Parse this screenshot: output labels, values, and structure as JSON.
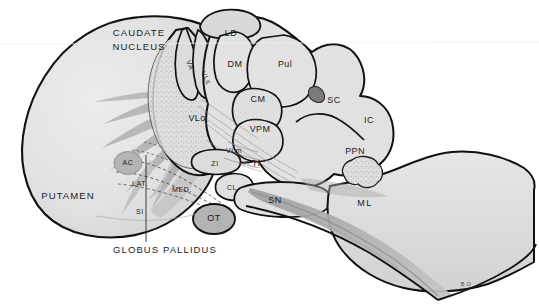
{
  "figure": {
    "signature": "B.O",
    "background_color": "#ffffff",
    "outline_color": "#111111",
    "fill_light": "#e3e3e3",
    "fill_mid": "#c9c9c9",
    "fill_dark": "#a8a8a8",
    "fill_darker": "#9a9a9a"
  },
  "labels": {
    "caudate_line1": "CAUDATE",
    "caudate_line2": "NUCLEUS",
    "putamen": "PUTAMEN",
    "globus_pallidus": "GLOBUS PALLIDUS",
    "lat": "LAT.",
    "med": "MED.",
    "ac": "AC",
    "si": "SI",
    "ot": "OT",
    "ld": "LD",
    "va": "VA",
    "vlc": "VLc",
    "vlo": "VLo",
    "vlm": "VLm",
    "dm": "DM",
    "pul": "Pul",
    "cm": "CM",
    "vpm": "VPM",
    "zi": "ZI",
    "h": "H",
    "cl": "CL",
    "sn": "SN",
    "sc": "SC",
    "ic": "IC",
    "ppn": "PPN",
    "ml": "ML"
  },
  "structures": [
    {
      "abbr": "CAUDATE NUCLEUS",
      "name": "Caudate nucleus"
    },
    {
      "abbr": "PUTAMEN",
      "name": "Putamen"
    },
    {
      "abbr": "GLOBUS PALLIDUS",
      "name": "Globus pallidus"
    },
    {
      "abbr": "LAT.",
      "name": "Lateral globus pallidus segment"
    },
    {
      "abbr": "MED.",
      "name": "Medial globus pallidus segment"
    },
    {
      "abbr": "AC",
      "name": "Anterior commissure"
    },
    {
      "abbr": "SI",
      "name": "Substantia innominata"
    },
    {
      "abbr": "OT",
      "name": "Optic tract"
    },
    {
      "abbr": "LD",
      "name": "Laterodorsal nucleus"
    },
    {
      "abbr": "VA",
      "name": "Ventral anterior nucleus"
    },
    {
      "abbr": "VLc",
      "name": "Ventral lateral caudal nucleus"
    },
    {
      "abbr": "VLo",
      "name": "Ventral lateral oral nucleus"
    },
    {
      "abbr": "VLm",
      "name": "Ventral lateral medial nucleus"
    },
    {
      "abbr": "DM",
      "name": "Dorsomedial nucleus"
    },
    {
      "abbr": "Pul",
      "name": "Pulvinar"
    },
    {
      "abbr": "CM",
      "name": "Centromedian nucleus"
    },
    {
      "abbr": "VPM",
      "name": "Ventral posteromedial nucleus"
    },
    {
      "abbr": "ZI",
      "name": "Zona incerta"
    },
    {
      "abbr": "H",
      "name": "Field H of Forel"
    },
    {
      "abbr": "CL",
      "name": "Caudal nucleus / campus"
    },
    {
      "abbr": "SN",
      "name": "Substantia nigra"
    },
    {
      "abbr": "SC",
      "name": "Superior colliculus"
    },
    {
      "abbr": "IC",
      "name": "Inferior colliculus"
    },
    {
      "abbr": "PPN",
      "name": "Pedunculopontine nucleus"
    },
    {
      "abbr": "ML",
      "name": "Medial lemniscus"
    }
  ]
}
